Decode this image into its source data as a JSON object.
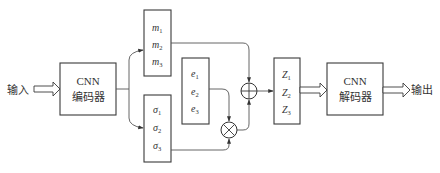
{
  "input": {
    "label": "输入"
  },
  "output": {
    "label": "输出"
  },
  "encoder": {
    "line1": "CNN",
    "line2": "编码器"
  },
  "decoder": {
    "line1": "CNN",
    "line2": "解码器"
  },
  "mean_box": {
    "items": [
      {
        "symbol": "m",
        "sub": "1"
      },
      {
        "symbol": "m",
        "sub": "2"
      },
      {
        "symbol": "m",
        "sub": "3"
      }
    ]
  },
  "sigma_box": {
    "items": [
      {
        "symbol": "σ",
        "sub": "1"
      },
      {
        "symbol": "σ",
        "sub": "2"
      },
      {
        "symbol": "σ",
        "sub": "3"
      }
    ]
  },
  "epsilon_box": {
    "items": [
      {
        "symbol": "e",
        "sub": "1"
      },
      {
        "symbol": "e",
        "sub": "2"
      },
      {
        "symbol": "e",
        "sub": "3"
      }
    ]
  },
  "latent_box": {
    "items": [
      {
        "symbol": "Z",
        "sub": "1"
      },
      {
        "symbol": "Z",
        "sub": "2"
      },
      {
        "symbol": "Z",
        "sub": "3"
      }
    ]
  },
  "operators": {
    "add": "plus-circle",
    "multiply": "times-circle"
  }
}
